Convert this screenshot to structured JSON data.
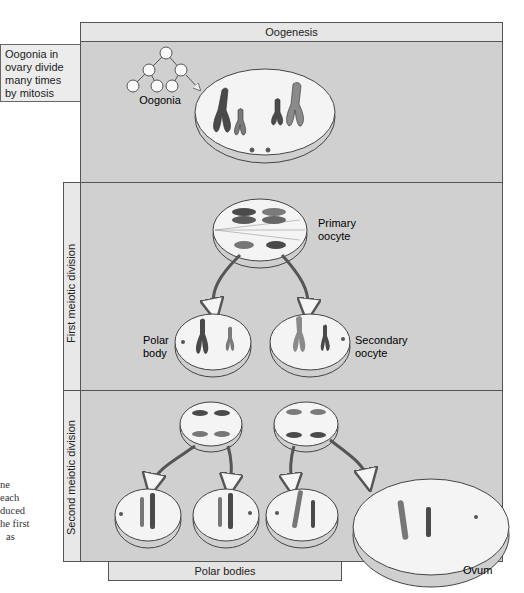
{
  "title": "Oogenesis",
  "side_note": [
    "Oogonia in",
    "ovary divide",
    "many times",
    "by mitosis"
  ],
  "stages": {
    "first": "First meiotic division",
    "second": "Second meiotic division"
  },
  "labels": {
    "oogonia": "Oogonia",
    "primary_oocyte": [
      "Primary",
      "oocyte"
    ],
    "polar_body": [
      "Polar",
      "body"
    ],
    "secondary_oocyte": [
      "Secondary",
      "oocyte"
    ],
    "polar_bodies": "Polar bodies",
    "ovum": "Ovum"
  },
  "caption_fragment": [
    "ne",
    "each",
    "duced",
    "he first",
    "as"
  ],
  "colors": {
    "panel_bg": "#d0d0d0",
    "header_bg": "#e6e6e6",
    "cell_fill": "#f3f3f3",
    "chrom_dark": "#4a4a4a",
    "chrom_mid": "#777777",
    "chrom_light": "#8c8c8c"
  }
}
